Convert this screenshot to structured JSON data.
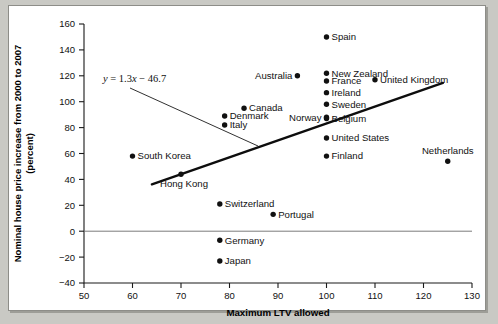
{
  "figure": {
    "background_color": "#c9c9c4",
    "panel_color": "#ffffff",
    "border_color": "#8d8d88"
  },
  "chart_data": {
    "type": "scatter",
    "title": "",
    "xlabel": "Maximum LTV allowed",
    "ylabel": "Nominal house price increase from 2000 to 2007 (percent)",
    "ylabel_line1": "Nominal house price increase from 2000 to 2007",
    "ylabel_line2": "(percent)",
    "xlim": [
      50,
      130
    ],
    "ylim": [
      -40,
      160
    ],
    "xticks": [
      50,
      60,
      70,
      80,
      90,
      100,
      110,
      120,
      130
    ],
    "yticks": [
      -40,
      -20,
      0,
      20,
      40,
      60,
      80,
      100,
      120,
      140,
      160
    ],
    "grid": false,
    "zero_line": true,
    "legend": "none",
    "annotation": {
      "text": "y = 1.3x − 46.7",
      "equation_var": "y",
      "slope": 1.3,
      "intercept": -46.7
    },
    "trendline": {
      "x": [
        64,
        124
      ],
      "y": [
        36.2,
        114.5
      ]
    },
    "points": [
      {
        "label": "Spain",
        "x": 100,
        "y": 150,
        "label_side": "right"
      },
      {
        "label": "New Zealand",
        "x": 100,
        "y": 122,
        "label_side": "right"
      },
      {
        "label": "France",
        "x": 100,
        "y": 116,
        "label_side": "right"
      },
      {
        "label": "Ireland",
        "x": 100,
        "y": 107,
        "label_side": "right"
      },
      {
        "label": "Sweden",
        "x": 100,
        "y": 98,
        "label_side": "right"
      },
      {
        "label": "Belgium",
        "x": 100,
        "y": 87,
        "label_side": "right"
      },
      {
        "label": "United States",
        "x": 100,
        "y": 72,
        "label_side": "right"
      },
      {
        "label": "Finland",
        "x": 100,
        "y": 58,
        "label_side": "right"
      },
      {
        "label": "Australia",
        "x": 94,
        "y": 120,
        "label_side": "left"
      },
      {
        "label": "United Kingdom",
        "x": 110,
        "y": 117,
        "label_side": "right"
      },
      {
        "label": "Netherlands",
        "x": 125,
        "y": 54,
        "label_side": "above"
      },
      {
        "label": "Canada",
        "x": 83,
        "y": 95,
        "label_side": "right"
      },
      {
        "label": "Denmark",
        "x": 79,
        "y": 89,
        "label_side": "right"
      },
      {
        "label": "Italy",
        "x": 79,
        "y": 82,
        "label_side": "right"
      },
      {
        "label": "Norway",
        "x": 100,
        "y": 88,
        "label_side": "left"
      },
      {
        "label": "South Korea",
        "x": 60,
        "y": 58,
        "label_side": "right"
      },
      {
        "label": "Hong Kong",
        "x": 70,
        "y": 44,
        "label_side": "below"
      },
      {
        "label": "Switzerland",
        "x": 78,
        "y": 21,
        "label_side": "right"
      },
      {
        "label": "Portugal",
        "x": 89,
        "y": 13,
        "label_side": "right"
      },
      {
        "label": "Germany",
        "x": 78,
        "y": -7,
        "label_side": "right"
      },
      {
        "label": "Japan",
        "x": 78,
        "y": -23,
        "label_side": "right"
      }
    ]
  }
}
